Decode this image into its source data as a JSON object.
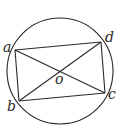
{
  "diagram": {
    "type": "geometry",
    "stroke_color": "#2a2a2a",
    "circle": {
      "cx": 60,
      "cy": 71,
      "r": 53
    },
    "points": {
      "a": {
        "label": "a",
        "x": 15,
        "y": 50
      },
      "b": {
        "label": "b",
        "x": 19,
        "y": 101
      },
      "c": {
        "label": "c",
        "x": 105,
        "y": 93
      },
      "d": {
        "label": "d",
        "x": 101,
        "y": 42
      },
      "o": {
        "label": "o",
        "x": 60,
        "y": 72
      }
    },
    "segments": [
      [
        "a",
        "d"
      ],
      [
        "d",
        "c"
      ],
      [
        "c",
        "b"
      ],
      [
        "b",
        "a"
      ],
      [
        "a",
        "c"
      ],
      [
        "b",
        "d"
      ]
    ]
  }
}
